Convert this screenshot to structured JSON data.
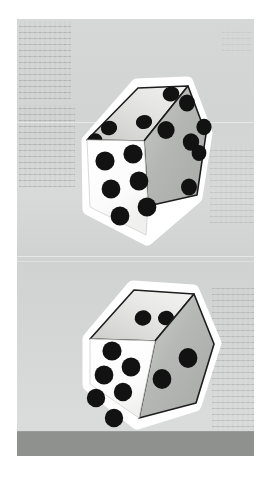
{
  "scene": {
    "title": "Two white dice in mid-air",
    "subject": "dice",
    "count": 2,
    "background_color": "#d3d5d4",
    "floor_band_color": "#8f918f",
    "die_body_color": "#ffffff",
    "die_top_face_color": "#dcdcdc",
    "die_right_face_color": "#b9bbb9",
    "pip_color": "#121212",
    "edge_color": "#1a1a1a",
    "glow_color": "#ffffff"
  },
  "dice": [
    {
      "id": "die-top",
      "label": "upper-die",
      "faces": [
        {
          "name": "front-face",
          "pips": 6,
          "shade": "white",
          "color": "#ffffff"
        },
        {
          "name": "top-face",
          "pips": 4,
          "shade": "light-gray",
          "color": "#dcdcdc"
        },
        {
          "name": "right-face",
          "pips": 6,
          "shade": "mid-gray",
          "color": "#b9bbb9"
        }
      ],
      "total_visible_pips": 16
    },
    {
      "id": "die-bottom",
      "label": "lower-die",
      "faces": [
        {
          "name": "front-face",
          "pips": 6,
          "shade": "white",
          "color": "#ffffff"
        },
        {
          "name": "top-face",
          "pips": 3,
          "shade": "light-gray",
          "color": "#dcdcdc"
        },
        {
          "name": "right-face",
          "pips": 2,
          "shade": "mid-gray",
          "color": "#b9bbb9"
        }
      ],
      "total_visible_pips": 11
    }
  ],
  "backdrop": {
    "texture": "faint-printed-text",
    "seams": 3
  }
}
